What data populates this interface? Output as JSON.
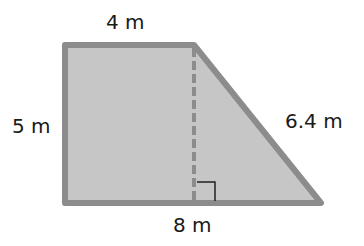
{
  "diagram": {
    "shape": "trapezoid",
    "labels": {
      "top": "4 m",
      "left": "5 m",
      "slant": "6.4 m",
      "bottom": "8 m"
    },
    "colors": {
      "fill": "#c6c6c6",
      "stroke": "#8c8c8c",
      "right_angle": "#222222",
      "text": "#1a1a1a"
    }
  }
}
